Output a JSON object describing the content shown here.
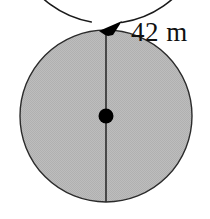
{
  "figure": {
    "background_color": "#ffffff",
    "label": {
      "text": "42 m",
      "value": 42,
      "unit": "m",
      "quantity": "diameter",
      "color": "#111111"
    },
    "shapes": {
      "outer_circle": {
        "name": "circumference-arc",
        "center_x": 105,
        "center_y": 118,
        "radius": 97,
        "stroke_color": "#1a1a1a",
        "stroke_width": 1.6,
        "fill": "none",
        "gap_degrees": 18
      },
      "inner_circle": {
        "name": "shaded-disc",
        "center_x": 106,
        "center_y": 116,
        "radius": 86,
        "fill_color": "#b8b8b8",
        "stroke_color": "#2b2b2b",
        "stroke_width": 1.4
      },
      "diameter_line": {
        "name": "vertical-diameter",
        "x": 106,
        "y_top": 30,
        "y_bottom": 202,
        "stroke_color": "#2b2b2b",
        "stroke_width": 1.6
      },
      "center_dot": {
        "name": "center-point",
        "center_x": 106,
        "center_y": 116,
        "radius": 7.5,
        "fill_color": "#000000"
      },
      "arrow_head": {
        "name": "direction-arrowhead",
        "tip_x": 122,
        "tip_y": 22,
        "fill_color": "#000000",
        "points": "122,21 99,31 105,35 108,36 113,35"
      }
    }
  }
}
